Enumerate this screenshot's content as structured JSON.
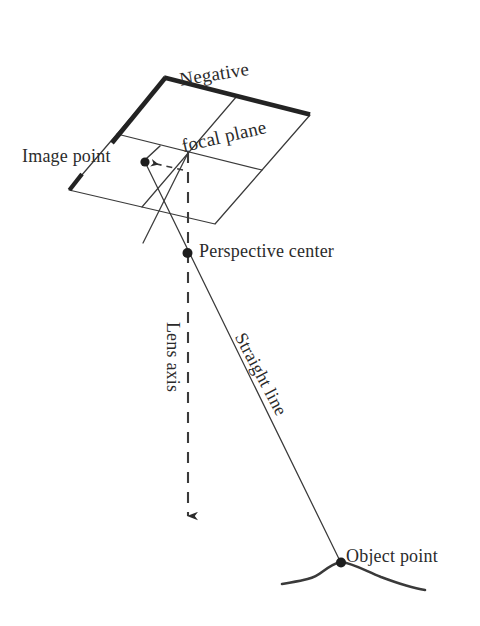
{
  "figure": {
    "kind": "photogrammetry-collinearity-diagram",
    "background_color": "#ffffff",
    "ink_color": "#2b2b2b"
  },
  "title": {
    "line1": "Negative",
    "line2": "focal plane"
  },
  "labels": {
    "image_point": "Image point",
    "perspective_center": "Perspective center",
    "object_point": "Object point",
    "lens_axis": "Lens axis",
    "straight_line": "Straight line"
  },
  "geometry": {
    "negative_focal_plane": {
      "corners": {
        "top": [
          165,
          78
        ],
        "right": [
          310,
          115
        ],
        "bottom": [
          215,
          224
        ],
        "left": [
          69,
          190
        ]
      },
      "thick_edges": [
        "left-to-top",
        "top-to-right",
        "left-stub"
      ],
      "grid_lines": [
        "mid-horizontal",
        "mid-diagonal"
      ]
    },
    "points": {
      "image_point": [
        145,
        162
      ],
      "perspective_center": [
        187,
        253
      ],
      "plane_center": [
        188,
        152
      ],
      "object_point": [
        341,
        563
      ]
    },
    "lens_axis": {
      "from": [
        188,
        152
      ],
      "to": [
        188,
        525
      ],
      "style": "dashed",
      "arrow": "down"
    },
    "straight_line": {
      "from": [
        145,
        162
      ],
      "through": [
        187,
        253
      ],
      "to": [
        341,
        563
      ],
      "style": "solid"
    },
    "terrain": {
      "from": [
        282,
        583
      ],
      "to": [
        425,
        589
      ],
      "peak_at_object_point": true
    }
  }
}
